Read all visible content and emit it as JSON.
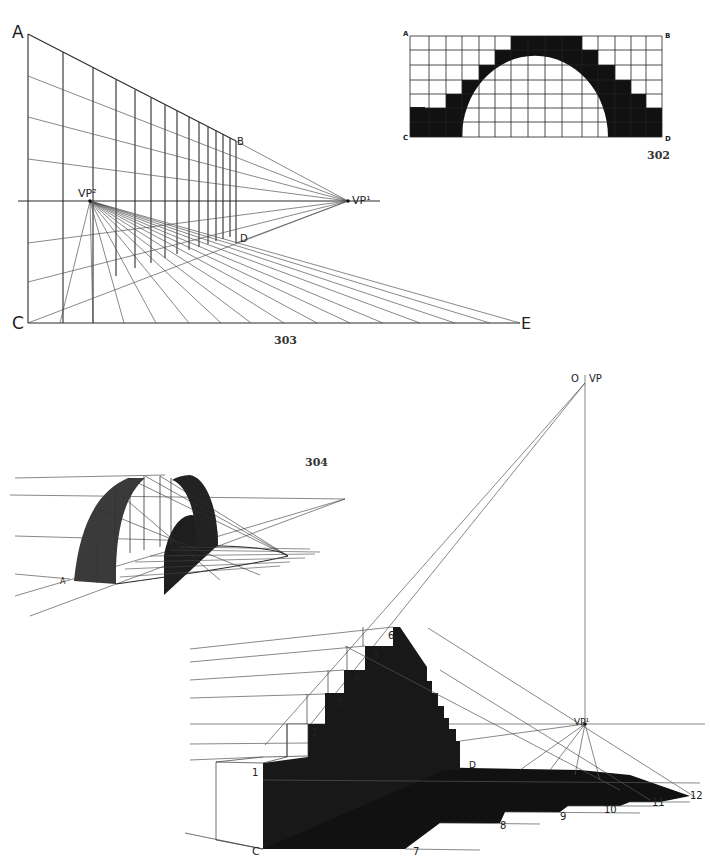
{
  "figures": [
    {
      "id": "fig302",
      "caption": "302",
      "description": "Flat grid elevation of a stepped arch",
      "labels": {
        "a": "A",
        "b": "B",
        "c": "C",
        "d": "D"
      },
      "grid": {
        "columns": 15,
        "rows": 7
      }
    },
    {
      "id": "fig303",
      "caption": "303",
      "description": "Perspective grid with two vanishing points",
      "labels": {
        "a": "A",
        "b": "B",
        "c": "C",
        "d": "D",
        "e": "E",
        "vp1": "VP¹",
        "vp2": "VP²"
      }
    },
    {
      "id": "fig304",
      "caption": "304",
      "description": "Arch in perspective with its shadow",
      "labels": {
        "a": "A",
        "b": "B"
      }
    },
    {
      "id": "fig305",
      "description": "Stepped block with cast shadow using vanishing points",
      "labels": {
        "c": "C",
        "d": "D",
        "o": "O",
        "vp": "VP",
        "vp1": "VP¹"
      },
      "step_numbers": [
        "1",
        "2",
        "3",
        "4",
        "5",
        "6",
        "7",
        "8",
        "9",
        "10",
        "11",
        "12"
      ]
    }
  ],
  "colors": {
    "ink": "#222222",
    "fill": "#1a1a1a",
    "paper": "#ffffff"
  }
}
